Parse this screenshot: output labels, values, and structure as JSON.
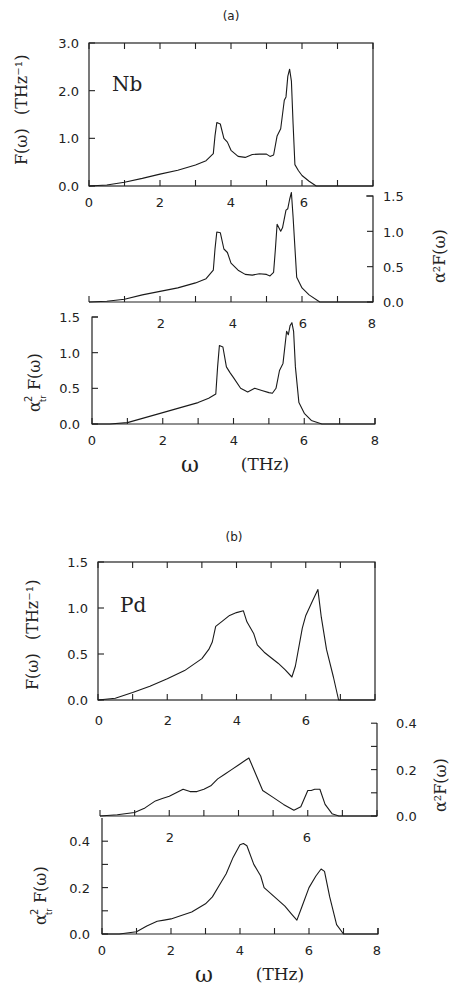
{
  "figure": {
    "panel_a_label": "(a)",
    "panel_b_label": "(b)",
    "xlabel_symbol": "ω",
    "xlabel_unit": "(THz)"
  },
  "chart_data": [
    {
      "id": "nb_F",
      "type": "line",
      "group": "(a)",
      "annotation": "Nb",
      "title": "",
      "xlabel": "",
      "ylabel": "F(ω)  (THz⁻¹)",
      "ylabel_side": "left",
      "xlim": [
        0,
        8
      ],
      "ylim": [
        0,
        3.0
      ],
      "xticks": [
        0,
        1,
        2,
        3,
        4,
        5,
        6,
        7,
        8
      ],
      "xtick_labels": [
        "0",
        "2",
        "4",
        "6"
      ],
      "xtick_label_values": [
        0,
        2,
        4,
        6
      ],
      "yticks": [
        0,
        1.0,
        2.0,
        3.0
      ],
      "ytick_labels": [
        "0.0",
        "1.0",
        "2.0",
        "3.0"
      ],
      "grid": false,
      "x": [
        0.0,
        0.5,
        1.0,
        1.5,
        2.0,
        2.5,
        3.0,
        3.3,
        3.5,
        3.55,
        3.6,
        3.7,
        3.8,
        3.9,
        4.0,
        4.2,
        4.4,
        4.6,
        4.8,
        5.0,
        5.1,
        5.2,
        5.3,
        5.4,
        5.5,
        5.55,
        5.6,
        5.65,
        5.7,
        5.75,
        5.8,
        5.9,
        6.0,
        6.2,
        6.4,
        8.0
      ],
      "y": [
        0.0,
        0.02,
        0.08,
        0.16,
        0.25,
        0.33,
        0.44,
        0.53,
        0.68,
        1.05,
        1.33,
        1.3,
        1.0,
        0.92,
        0.75,
        0.62,
        0.6,
        0.66,
        0.67,
        0.67,
        0.62,
        0.65,
        1.05,
        1.2,
        1.8,
        1.87,
        2.3,
        2.45,
        2.2,
        1.3,
        0.45,
        0.32,
        0.22,
        0.1,
        0.0,
        0.0
      ]
    },
    {
      "id": "nb_a2F",
      "type": "line",
      "group": "(a)",
      "ylabel": "α²F(ω)",
      "ylabel_side": "right",
      "xlim": [
        0,
        8
      ],
      "ylim": [
        0,
        1.5
      ],
      "xticks": [
        0,
        1,
        2,
        3,
        4,
        5,
        6,
        7,
        8
      ],
      "xtick_labels": [
        "2",
        "4",
        "6",
        "8"
      ],
      "xtick_label_values": [
        2,
        4,
        6,
        8
      ],
      "yticks": [
        0,
        0.5,
        1.0,
        1.5
      ],
      "ytick_labels": [
        "0.0",
        "0.5",
        "1.0",
        "1.5"
      ],
      "grid": false,
      "x": [
        0.0,
        0.5,
        1.0,
        1.5,
        2.0,
        2.5,
        3.0,
        3.3,
        3.5,
        3.55,
        3.6,
        3.7,
        3.8,
        3.9,
        4.0,
        4.2,
        4.4,
        4.6,
        4.8,
        5.0,
        5.1,
        5.2,
        5.25,
        5.3,
        5.4,
        5.45,
        5.55,
        5.6,
        5.65,
        5.7,
        5.75,
        5.85,
        6.0,
        6.2,
        6.5,
        8.0
      ],
      "y": [
        0.0,
        0.01,
        0.04,
        0.1,
        0.15,
        0.2,
        0.27,
        0.33,
        0.45,
        0.75,
        0.99,
        0.98,
        0.75,
        0.7,
        0.55,
        0.45,
        0.39,
        0.38,
        0.4,
        0.39,
        0.37,
        0.42,
        0.75,
        1.1,
        1.0,
        1.05,
        1.3,
        1.32,
        1.45,
        1.55,
        1.2,
        0.35,
        0.2,
        0.1,
        0.0,
        0.0
      ]
    },
    {
      "id": "nb_atrF",
      "type": "line",
      "group": "(a)",
      "ylabel": "α²_tr F(ω)",
      "ylabel_side": "left",
      "xlabel": "ω (THz)",
      "xlim": [
        0,
        8
      ],
      "ylim": [
        0,
        1.5
      ],
      "xticks": [
        0,
        1,
        2,
        3,
        4,
        5,
        6,
        7,
        8
      ],
      "xtick_labels_top": [
        "2",
        "4",
        "6",
        "8"
      ],
      "xtick_labels": [
        "0",
        "2",
        "4",
        "6",
        "8"
      ],
      "yticks": [
        0,
        0.5,
        1.0,
        1.5
      ],
      "ytick_labels": [
        "0.0",
        "0.5",
        "1.0",
        "1.5"
      ],
      "grid": false,
      "x": [
        0.0,
        0.5,
        1.0,
        1.5,
        2.0,
        2.5,
        3.0,
        3.3,
        3.5,
        3.55,
        3.6,
        3.7,
        3.8,
        3.9,
        4.0,
        4.2,
        4.4,
        4.6,
        4.8,
        5.0,
        5.1,
        5.2,
        5.3,
        5.4,
        5.5,
        5.55,
        5.6,
        5.65,
        5.7,
        5.75,
        5.85,
        6.0,
        6.2,
        6.5,
        8.0
      ],
      "y": [
        0.0,
        0.0,
        0.02,
        0.09,
        0.16,
        0.23,
        0.3,
        0.36,
        0.42,
        0.8,
        1.1,
        1.08,
        0.8,
        0.72,
        0.65,
        0.5,
        0.45,
        0.5,
        0.47,
        0.44,
        0.43,
        0.5,
        0.75,
        0.85,
        1.3,
        1.25,
        1.38,
        1.42,
        1.3,
        0.8,
        0.3,
        0.15,
        0.05,
        0.0,
        0.0
      ]
    },
    {
      "id": "pd_F",
      "type": "line",
      "group": "(b)",
      "annotation": "Pd",
      "ylabel": "F(ω)  (THz⁻¹)",
      "ylabel_side": "left",
      "xlim": [
        0,
        8
      ],
      "ylim": [
        0,
        1.5
      ],
      "xticks": [
        0,
        1,
        2,
        3,
        4,
        5,
        6,
        7,
        8
      ],
      "xtick_labels": [
        "0",
        "2",
        "4",
        "6"
      ],
      "yticks": [
        0,
        0.5,
        1.0,
        1.5
      ],
      "ytick_labels": [
        "0.0",
        "0.5",
        "1.0",
        "1.5"
      ],
      "grid": false,
      "x": [
        0.0,
        0.5,
        1.0,
        1.5,
        2.0,
        2.5,
        3.0,
        3.2,
        3.3,
        3.4,
        3.6,
        3.8,
        4.0,
        4.2,
        4.3,
        4.5,
        4.6,
        4.8,
        5.0,
        5.2,
        5.4,
        5.6,
        5.7,
        5.9,
        6.0,
        6.2,
        6.35,
        6.45,
        6.6,
        6.8,
        6.95,
        8.0
      ],
      "y": [
        0.0,
        0.02,
        0.08,
        0.15,
        0.23,
        0.32,
        0.45,
        0.55,
        0.63,
        0.8,
        0.86,
        0.92,
        0.95,
        0.97,
        0.85,
        0.72,
        0.6,
        0.52,
        0.46,
        0.4,
        0.33,
        0.25,
        0.37,
        0.78,
        0.92,
        1.08,
        1.2,
        0.9,
        0.55,
        0.25,
        0.0,
        0.0
      ]
    },
    {
      "id": "pd_a2F",
      "type": "line",
      "group": "(b)",
      "ylabel": "α²F(ω)",
      "ylabel_side": "right",
      "xlim": [
        0,
        8
      ],
      "ylim": [
        0,
        0.5
      ],
      "xticks": [
        0,
        1,
        2,
        3,
        4,
        5,
        6,
        7,
        8
      ],
      "xtick_labels": [
        "2",
        "6"
      ],
      "yticks": [
        0,
        0.1,
        0.2,
        0.3,
        0.4
      ],
      "ytick_labels": [
        "0.0",
        "0.2",
        "0.4"
      ],
      "ytick_label_values": [
        0,
        0.2,
        0.4
      ],
      "grid": false,
      "x": [
        0.0,
        0.5,
        1.0,
        1.3,
        1.6,
        1.8,
        2.0,
        2.2,
        2.4,
        2.6,
        2.8,
        3.0,
        3.2,
        3.4,
        3.6,
        3.8,
        4.0,
        4.2,
        4.3,
        4.5,
        4.7,
        5.0,
        5.3,
        5.6,
        5.8,
        6.0,
        6.1,
        6.2,
        6.35,
        6.5,
        6.7,
        6.9,
        8.0
      ],
      "y": [
        0.0,
        0.005,
        0.015,
        0.035,
        0.065,
        0.075,
        0.085,
        0.1,
        0.115,
        0.105,
        0.105,
        0.115,
        0.13,
        0.16,
        0.18,
        0.2,
        0.22,
        0.24,
        0.25,
        0.18,
        0.11,
        0.08,
        0.05,
        0.025,
        0.04,
        0.11,
        0.11,
        0.115,
        0.115,
        0.05,
        0.01,
        0.0,
        0.0
      ]
    },
    {
      "id": "pd_atrF",
      "type": "line",
      "group": "(b)",
      "ylabel": "α²_tr F(ω)",
      "ylabel_side": "left",
      "xlabel": "ω (THz)",
      "xlim": [
        0,
        8
      ],
      "ylim": [
        0,
        0.5
      ],
      "xticks": [
        0,
        1,
        2,
        3,
        4,
        5,
        6,
        7,
        8
      ],
      "xtick_labels_top": [
        "2",
        "6"
      ],
      "xtick_labels": [
        "0",
        "2",
        "4",
        "6",
        "8"
      ],
      "yticks": [
        0,
        0.1,
        0.2,
        0.3,
        0.4
      ],
      "ytick_labels": [
        "0.0",
        "0.2",
        "0.4"
      ],
      "ytick_label_values": [
        0,
        0.2,
        0.4
      ],
      "grid": false,
      "x": [
        0.0,
        0.5,
        1.0,
        1.3,
        1.6,
        1.8,
        2.0,
        2.3,
        2.6,
        3.0,
        3.2,
        3.4,
        3.6,
        3.8,
        4.0,
        4.1,
        4.2,
        4.4,
        4.6,
        4.7,
        5.0,
        5.3,
        5.5,
        5.65,
        5.8,
        6.0,
        6.2,
        6.35,
        6.45,
        6.6,
        6.8,
        7.0,
        8.0
      ],
      "y": [
        0.0,
        0.0,
        0.01,
        0.035,
        0.055,
        0.06,
        0.065,
        0.08,
        0.095,
        0.13,
        0.16,
        0.21,
        0.26,
        0.33,
        0.385,
        0.39,
        0.38,
        0.3,
        0.25,
        0.2,
        0.16,
        0.12,
        0.085,
        0.06,
        0.12,
        0.2,
        0.25,
        0.28,
        0.27,
        0.16,
        0.04,
        0.0,
        0.0
      ]
    }
  ],
  "panels": {
    "nb_F": {
      "ytick_labels": [
        "0.0",
        "1.0",
        "2.0",
        "3.0"
      ],
      "xtick_labels": [
        "0",
        "2",
        "4",
        "6"
      ],
      "annotation": "Nb",
      "ylabel_main": "F(ω)",
      "ylabel_unit": "(THz⁻¹)"
    },
    "nb_a2F": {
      "ytick_labels": [
        "0.0",
        "0.5",
        "1.0",
        "1.5"
      ],
      "ylabel_main": "α²F(ω)"
    },
    "nb_atrF": {
      "ytick_labels": [
        "0.0",
        "0.5",
        "1.0",
        "1.5"
      ],
      "xtick_labels_top": [
        "2",
        "4",
        "6",
        "8"
      ],
      "xtick_labels": [
        "0",
        "2",
        "4",
        "6",
        "8"
      ],
      "ylabel_alpha": "α",
      "ylabel_sup": "2",
      "ylabel_sub": "tr",
      "ylabel_rest": "F(ω)"
    },
    "pd_F": {
      "ytick_labels": [
        "0.0",
        "0.5",
        "1.0",
        "1.5"
      ],
      "xtick_labels": [
        "0",
        "2",
        "4",
        "6"
      ],
      "annotation": "Pd",
      "ylabel_main": "F(ω)",
      "ylabel_unit": "(THz⁻¹)"
    },
    "pd_a2F": {
      "ytick_labels": [
        "0.0",
        "0.2",
        "0.4"
      ],
      "ylabel_main": "α²F(ω)"
    },
    "pd_atrF": {
      "ytick_labels": [
        "0.0",
        "0.2",
        "0.4"
      ],
      "xtick_labels_top": [
        "2",
        "6"
      ],
      "xtick_labels": [
        "0",
        "2",
        "4",
        "6",
        "8"
      ],
      "ylabel_alpha": "α",
      "ylabel_sup": "2",
      "ylabel_sub": "tr",
      "ylabel_rest": "F(ω)"
    }
  }
}
